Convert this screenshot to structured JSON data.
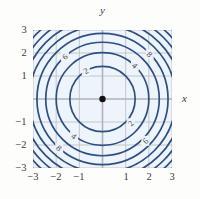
{
  "figure": {
    "kind": "contour-plot",
    "origin_marker": "filled-dot",
    "plot_background": "#eef4fb",
    "contour_color": "#2d4f82",
    "grid_color": "#b9bcc0",
    "axis_color": "#b0b3b7"
  },
  "axes": {
    "x_label": "x",
    "y_label": "y",
    "xlim": [
      -3,
      3
    ],
    "ylim": [
      -3,
      3
    ],
    "x_ticks": [
      "−3",
      "−2",
      "−1",
      "1",
      "2",
      "3"
    ],
    "x_tick_values": [
      -3,
      -2,
      -1,
      1,
      2,
      3
    ],
    "y_ticks": [
      "3",
      "2",
      "1",
      "−1",
      "−2",
      "−3"
    ],
    "y_tick_values": [
      3,
      2,
      1,
      -1,
      -2,
      -3
    ],
    "grid": true
  },
  "chart_data": {
    "type": "line",
    "title": "",
    "xlabel": "x",
    "ylabel": "y",
    "xlim": [
      -3,
      3
    ],
    "ylim": [
      -3,
      3
    ],
    "grid": true,
    "legend": "none",
    "contour_levels": [
      2,
      4,
      6,
      8,
      10,
      12,
      14,
      16,
      18
    ],
    "level_radii": [
      1.41,
      2.0,
      2.45,
      2.83,
      3.16,
      3.46,
      3.74,
      4.0,
      4.24
    ],
    "level_labels_shown": [
      "2",
      "4",
      "6",
      "8"
    ],
    "annotations": [
      {
        "text": "2",
        "x": -0.72,
        "y": 1.22,
        "quadrant": "upper-left"
      },
      {
        "text": "6",
        "x": -1.62,
        "y": 1.84,
        "quadrant": "upper-left"
      },
      {
        "text": "4",
        "x": 1.4,
        "y": 1.45,
        "quadrant": "upper-right"
      },
      {
        "text": "8",
        "x": 2.04,
        "y": 1.95,
        "quadrant": "upper-right"
      },
      {
        "text": "4",
        "x": -1.23,
        "y": -1.62,
        "quadrant": "lower-left"
      },
      {
        "text": "8",
        "x": -1.87,
        "y": -2.13,
        "quadrant": "lower-left"
      },
      {
        "text": "2",
        "x": 1.21,
        "y": -1.05,
        "quadrant": "lower-right"
      },
      {
        "text": "6",
        "x": 1.85,
        "y": -1.82,
        "quadrant": "lower-right"
      }
    ],
    "marker_points": [
      {
        "x": 0,
        "y": 0,
        "style": "filled-circle",
        "color": "#111111"
      }
    ]
  }
}
